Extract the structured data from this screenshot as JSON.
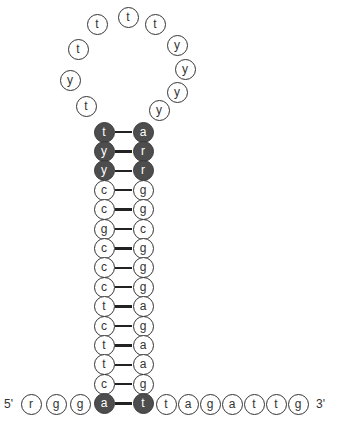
{
  "diagram": {
    "type": "hairpin-secondary-structure",
    "five_prime_label": "5'",
    "three_prime_label": "3'",
    "colors": {
      "paired_highlight": "#4d4d4d",
      "outline": "#333333",
      "background": "#ffffff"
    },
    "loop": [
      {
        "base": "t",
        "x": 86,
        "y": 106
      },
      {
        "base": "y",
        "x": 70,
        "y": 80
      },
      {
        "base": "t",
        "x": 78,
        "y": 49
      },
      {
        "base": "t",
        "x": 97,
        "y": 24
      },
      {
        "base": "t",
        "x": 128,
        "y": 17
      },
      {
        "base": "t",
        "x": 155,
        "y": 24
      },
      {
        "base": "y",
        "x": 177,
        "y": 45
      },
      {
        "base": "y",
        "x": 185,
        "y": 69
      },
      {
        "base": "y",
        "x": 177,
        "y": 92
      },
      {
        "base": "y",
        "x": 159,
        "y": 110
      }
    ],
    "stem": {
      "left_x": 104,
      "right_x": 143,
      "top_y": 132,
      "row_spacing": 19.4,
      "pairs": [
        {
          "left": "t",
          "right": "a",
          "filled": true
        },
        {
          "left": "y",
          "right": "r",
          "filled": true
        },
        {
          "left": "y",
          "right": "r",
          "filled": true
        },
        {
          "left": "c",
          "right": "g",
          "filled": false
        },
        {
          "left": "c",
          "right": "g",
          "filled": false
        },
        {
          "left": "g",
          "right": "c",
          "filled": false
        },
        {
          "left": "c",
          "right": "g",
          "filled": false
        },
        {
          "left": "c",
          "right": "g",
          "filled": false
        },
        {
          "left": "c",
          "right": "g",
          "filled": false
        },
        {
          "left": "t",
          "right": "a",
          "filled": false
        },
        {
          "left": "c",
          "right": "g",
          "filled": false
        },
        {
          "left": "t",
          "right": "a",
          "filled": false
        },
        {
          "left": "t",
          "right": "a",
          "filled": false
        },
        {
          "left": "c",
          "right": "g",
          "filled": false
        },
        {
          "left": "a",
          "right": "t",
          "filled": true
        }
      ]
    },
    "five_prime_tail": [
      {
        "base": "r",
        "x": 31
      },
      {
        "base": "g",
        "x": 56
      },
      {
        "base": "g",
        "x": 80
      }
    ],
    "three_prime_tail": [
      {
        "base": "t",
        "x": 166
      },
      {
        "base": "a",
        "x": 188
      },
      {
        "base": "g",
        "x": 210
      },
      {
        "base": "a",
        "x": 232
      },
      {
        "base": "t",
        "x": 254
      },
      {
        "base": "t",
        "x": 276
      },
      {
        "base": "g",
        "x": 298
      }
    ],
    "tail_y": 404,
    "five_prime_label_x": 4,
    "three_prime_label_x": 316
  }
}
